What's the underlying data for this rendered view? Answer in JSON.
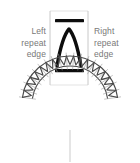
{
  "figure": {
    "background_color": "#ffffff"
  },
  "labels": {
    "left": {
      "line1": "Left",
      "line2": "repeat",
      "line3": "edge",
      "color": "#787878"
    },
    "right": {
      "line1": "Right",
      "line2": "repeat",
      "line3": "edge",
      "color": "#787878"
    }
  },
  "repeat_tile": {
    "name": "repeat-tile-frame",
    "frame_color": "#c8c8c8",
    "frame_left_x": 50,
    "frame_right_x": 88,
    "frame_top_y": 11,
    "frame_bottom_y": 85,
    "top_bar": {
      "name": "top-bar",
      "color": "#0d0d0d",
      "x": 55,
      "y": 19,
      "width": 29,
      "height": 3.2
    },
    "bottom_bar": {
      "name": "bottom-bar",
      "color": "#0d0d0d",
      "x": 55,
      "y": 69,
      "width": 29,
      "height": 3.2
    },
    "arch_motif": {
      "name": "arch-motif",
      "color": "#0d0d0d",
      "stroke_width": 3.4,
      "apex_x": 69,
      "apex_y": 29,
      "left_foot_x": 57,
      "right_foot_x": 81,
      "foot_y": 66
    }
  },
  "necklace": {
    "name": "necklace-curve",
    "stroke_color": "#4a4a4a",
    "outer_radius": 48,
    "inner_radius": 38,
    "center_x": 70,
    "center_y": 104,
    "motif_count": 19,
    "start_angle_deg": 188,
    "end_angle_deg": 352,
    "center_line_color": "#b4b4b4"
  }
}
